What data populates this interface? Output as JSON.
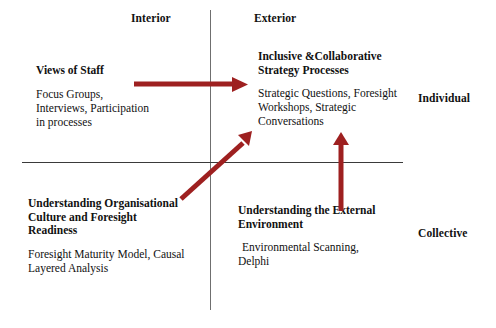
{
  "diagram": {
    "axes": {
      "vertical_label_top": "Interior",
      "vertical_label_right": "Exterior",
      "columns": [
        "Interior",
        "Exterior"
      ],
      "rows": [
        "Individual",
        "Collective"
      ],
      "axis_color": "#6f6f6f"
    },
    "column_labels": {
      "interior": "Interior",
      "exterior": "Exterior"
    },
    "row_labels": {
      "individual": "Individual",
      "collective": "Collective"
    },
    "quadrants": {
      "top_left": {
        "title": "Views of Staff",
        "body": "Focus Groups,\nInterviews, Participation\nin processes"
      },
      "top_right": {
        "title": "Inclusive &Collaborative\nStrategy Processes",
        "body": "Strategic Questions, Foresight\nWorkshops, Strategic\nConversations"
      },
      "bottom_left": {
        "title": "Understanding Organisational\nCulture and Foresight\nReadiness",
        "body": "Foresight Maturity Model, Causal\nLayered Analysis"
      },
      "bottom_right": {
        "title": "Understanding the External\nEnvironment",
        "body": "Environmental Scanning,\nDelphi"
      }
    },
    "arrows": [
      {
        "name": "arrow-staff-views-to-strategy",
        "direction": "right",
        "from": "Views of Staff",
        "to": "Inclusive &Collaborative Strategy Processes",
        "color": "#9e2020"
      },
      {
        "name": "arrow-culture-to-strategy",
        "direction": "diagonal-up-right",
        "from": "Understanding Organisational Culture and Foresight Readiness",
        "to": "Inclusive &Collaborative Strategy Processes",
        "color": "#9e2020"
      },
      {
        "name": "arrow-environment-to-strategy",
        "direction": "up",
        "from": "Understanding the External Environment",
        "to": "Inclusive &Collaborative Strategy Processes",
        "color": "#9e2020"
      }
    ],
    "colors": {
      "arrow": "#9e2020",
      "axis_vertical": "#6f6f6f",
      "axis_horizontal": "#3a3a3a",
      "text": "#111111",
      "background": "#ffffff"
    }
  }
}
